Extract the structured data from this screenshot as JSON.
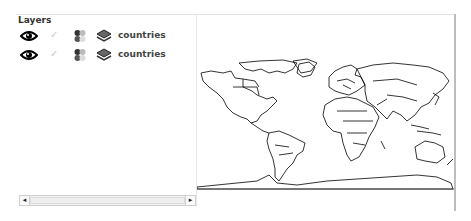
{
  "layers_panel": {
    "title": "Layers",
    "layers": [
      {
        "name": "countries",
        "visible_icon": "eye-icon",
        "selected_icon": "check-icon",
        "style_icon": "style-icon",
        "type_icon": "layer-stack-icon"
      },
      {
        "name": "countries",
        "visible_icon": "eye-icon",
        "selected_icon": "check-icon",
        "style_icon": "style-icon",
        "type_icon": "layer-stack-icon"
      }
    ],
    "scrollbar": {
      "left_arrow": "◂",
      "right_arrow": "▸"
    }
  },
  "map": {
    "description": "World map of country outlines",
    "stroke_color": "#000000",
    "background": "#ffffff"
  }
}
